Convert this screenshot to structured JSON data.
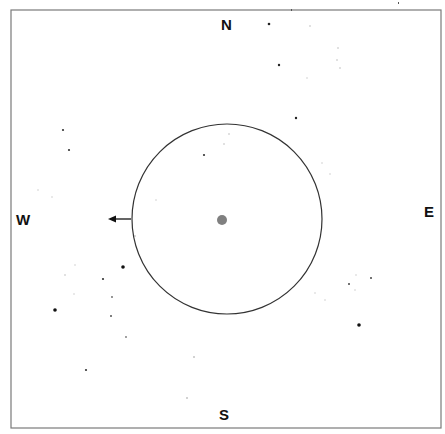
{
  "finder_chart": {
    "frame": {
      "x": 11,
      "y": 10,
      "width": 430,
      "height": 418,
      "stroke": "#7a7a7a"
    },
    "field_circle": {
      "cx": 227,
      "cy": 219,
      "r": 95,
      "stroke": "#333333"
    },
    "center_object": {
      "cx": 222,
      "cy": 220,
      "r": 5,
      "color": "#808080"
    },
    "direction_arrow": {
      "x1": 131,
      "y1": 219,
      "x2": 108,
      "y2": 219,
      "color": "#111111",
      "icon": "arrow-left-icon"
    },
    "labels": {
      "north": "N",
      "south": "S",
      "east": "E",
      "west": "W"
    },
    "stars": [
      {
        "x": 269,
        "y": 24,
        "r": 1.3,
        "c": "#222"
      },
      {
        "x": 279,
        "y": 65,
        "r": 1.2,
        "c": "#222"
      },
      {
        "x": 296,
        "y": 118,
        "r": 1.2,
        "c": "#222"
      },
      {
        "x": 310,
        "y": 26,
        "r": 0.8,
        "c": "#bbb"
      },
      {
        "x": 338,
        "y": 48,
        "r": 0.8,
        "c": "#bbb"
      },
      {
        "x": 337,
        "y": 60,
        "r": 0.8,
        "c": "#bbb"
      },
      {
        "x": 340,
        "y": 68,
        "r": 0.8,
        "c": "#bbb"
      },
      {
        "x": 307,
        "y": 78,
        "r": 0.8,
        "c": "#ccc"
      },
      {
        "x": 63,
        "y": 130,
        "r": 1.1,
        "c": "#333"
      },
      {
        "x": 69,
        "y": 150,
        "r": 1.1,
        "c": "#333"
      },
      {
        "x": 38,
        "y": 190,
        "r": 0.8,
        "c": "#ccc"
      },
      {
        "x": 52,
        "y": 197,
        "r": 0.8,
        "c": "#ccc"
      },
      {
        "x": 204,
        "y": 155,
        "r": 1.1,
        "c": "#333"
      },
      {
        "x": 229,
        "y": 134,
        "r": 0.8,
        "c": "#bbb"
      },
      {
        "x": 224,
        "y": 144,
        "r": 0.8,
        "c": "#bbb"
      },
      {
        "x": 322,
        "y": 163,
        "r": 0.8,
        "c": "#ccc"
      },
      {
        "x": 330,
        "y": 174,
        "r": 0.8,
        "c": "#ccc"
      },
      {
        "x": 156,
        "y": 200,
        "r": 0.8,
        "c": "#ccc"
      },
      {
        "x": 135,
        "y": 236,
        "r": 0.8,
        "c": "#aaa"
      },
      {
        "x": 123,
        "y": 267,
        "r": 1.8,
        "c": "#111"
      },
      {
        "x": 103,
        "y": 279,
        "r": 1.1,
        "c": "#333"
      },
      {
        "x": 55,
        "y": 310,
        "r": 1.8,
        "c": "#111"
      },
      {
        "x": 112,
        "y": 297,
        "r": 0.9,
        "c": "#666"
      },
      {
        "x": 111,
        "y": 316,
        "r": 1.0,
        "c": "#555"
      },
      {
        "x": 126,
        "y": 337,
        "r": 0.9,
        "c": "#777"
      },
      {
        "x": 86,
        "y": 370,
        "r": 1.1,
        "c": "#333"
      },
      {
        "x": 65,
        "y": 275,
        "r": 0.8,
        "c": "#bbb"
      },
      {
        "x": 74,
        "y": 294,
        "r": 0.8,
        "c": "#ccc"
      },
      {
        "x": 75,
        "y": 265,
        "r": 0.8,
        "c": "#ccc"
      },
      {
        "x": 349,
        "y": 284,
        "r": 1.0,
        "c": "#444"
      },
      {
        "x": 371,
        "y": 278,
        "r": 1.0,
        "c": "#444"
      },
      {
        "x": 359,
        "y": 325,
        "r": 1.8,
        "c": "#111"
      },
      {
        "x": 315,
        "y": 293,
        "r": 0.8,
        "c": "#ccc"
      },
      {
        "x": 325,
        "y": 300,
        "r": 0.8,
        "c": "#ccc"
      },
      {
        "x": 356,
        "y": 275,
        "r": 0.8,
        "c": "#ccc"
      },
      {
        "x": 355,
        "y": 290,
        "r": 0.8,
        "c": "#ccc"
      },
      {
        "x": 194,
        "y": 357,
        "r": 0.8,
        "c": "#999"
      },
      {
        "x": 187,
        "y": 398,
        "r": 0.8,
        "c": "#999"
      }
    ],
    "stray_marks": [
      {
        "x": 291,
        "y": 9
      },
      {
        "x": 398,
        "y": 2
      }
    ]
  }
}
